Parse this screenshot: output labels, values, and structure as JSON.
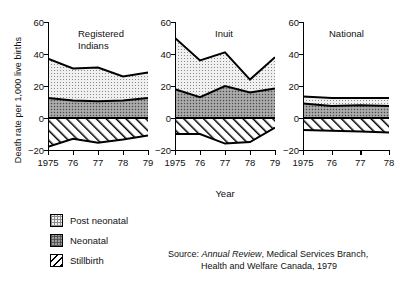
{
  "axes": {
    "ylabel": "Death rate per 1,000 live births",
    "xlabel": "Year",
    "yticks": [
      "60",
      "40",
      "20",
      "0",
      "−20"
    ],
    "ylim": [
      -20,
      60
    ]
  },
  "legend": {
    "items": [
      {
        "label": "Post neonatal",
        "pattern": "dots-light",
        "color": "#e3e3e3"
      },
      {
        "label": "Neonatal",
        "pattern": "dots-dark",
        "color": "#9a9a9a"
      },
      {
        "label": "Stillbirth",
        "pattern": "hatch",
        "color": "#ffffff"
      }
    ]
  },
  "source": {
    "prefix": "Source:",
    "italic": "Annual Review",
    "rest": ", Medical Services Branch,",
    "line2": "Health and Welfare Canada, 1979"
  },
  "panels": [
    {
      "title_line1": "Registered",
      "title_line2": "Indians",
      "xticks": [
        "1975",
        "76",
        "77",
        "78",
        "79"
      ]
    },
    {
      "title_line1": "Inuit",
      "title_line2": "",
      "xticks": [
        "1975",
        "76",
        "77",
        "78",
        "79"
      ]
    },
    {
      "title_line1": "National",
      "title_line2": "",
      "xticks": [
        "1975",
        "76",
        "77",
        "78"
      ]
    }
  ],
  "chart_data": {
    "type": "area",
    "title": "",
    "xlabel": "Year",
    "ylabel": "Death rate per 1,000 live births",
    "ylim": [
      -20,
      60
    ],
    "grid": false,
    "legend_position": "below-left",
    "note": "Stacked areas above zero (Neonatal then Post neonatal); Stillbirth plotted as negative values below zero.",
    "panels": [
      {
        "name": "Registered Indians",
        "x": [
          1975,
          1976,
          1977,
          1978,
          1979
        ],
        "xtick_labels": [
          "1975",
          "76",
          "77",
          "78",
          "79"
        ],
        "series": [
          {
            "name": "Neonatal",
            "cumulative_top": [
              12.5,
              11.0,
              10.5,
              11.0,
              12.5
            ],
            "values": [
              12.5,
              11.0,
              10.5,
              11.0,
              12.5
            ]
          },
          {
            "name": "Post neonatal",
            "cumulative_top": [
              37.0,
              31.0,
              31.5,
              26.0,
              28.5
            ],
            "values": [
              24.5,
              20.0,
              21.0,
              15.0,
              16.0
            ]
          },
          {
            "name": "Stillbirth",
            "values": [
              -18.0,
              -13.0,
              -15.5,
              -13.5,
              -11.0
            ]
          }
        ]
      },
      {
        "name": "Inuit",
        "x": [
          1975,
          1976,
          1977,
          1978,
          1979
        ],
        "xtick_labels": [
          "1975",
          "76",
          "77",
          "78",
          "79"
        ],
        "series": [
          {
            "name": "Neonatal",
            "cumulative_top": [
              18.0,
              13.0,
              20.0,
              16.0,
              18.5
            ],
            "values": [
              18.0,
              13.0,
              20.0,
              16.0,
              18.5
            ]
          },
          {
            "name": "Post neonatal",
            "cumulative_top": [
              50.0,
              36.0,
              41.0,
              24.0,
              38.0
            ],
            "values": [
              32.0,
              23.0,
              21.0,
              8.0,
              19.5
            ]
          },
          {
            "name": "Stillbirth",
            "values": [
              -10.0,
              -10.0,
              -16.0,
              -15.0,
              -6.0
            ]
          }
        ]
      },
      {
        "name": "National",
        "x": [
          1975,
          1976,
          1977,
          1978
        ],
        "xtick_labels": [
          "1975",
          "76",
          "77",
          "78"
        ],
        "series": [
          {
            "name": "Neonatal",
            "cumulative_top": [
              9.0,
              7.5,
              8.0,
              7.5
            ],
            "values": [
              9.0,
              7.5,
              8.0,
              7.5
            ]
          },
          {
            "name": "Post neonatal",
            "cumulative_top": [
              13.5,
              12.5,
              12.5,
              12.5
            ],
            "values": [
              4.5,
              5.0,
              4.5,
              5.0
            ]
          },
          {
            "name": "Stillbirth",
            "values": [
              -7.5,
              -8.0,
              -8.5,
              -9.0
            ]
          }
        ]
      }
    ]
  }
}
